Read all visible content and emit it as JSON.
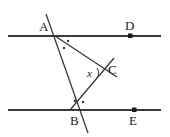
{
  "figure": {
    "type": "geometry-diagram",
    "background_color": "#ffffff",
    "stroke_color": "#3a3a3a",
    "text_color": "#1a1a1a"
  },
  "labels": {
    "a": "A",
    "b": "B",
    "c": "C",
    "d": "D",
    "e": "E",
    "x": "x"
  },
  "points": [
    {
      "name": "A",
      "label": "A",
      "x": 55,
      "y": 36,
      "label_x": 39,
      "label_y": 20,
      "marked_dot": false
    },
    {
      "name": "B",
      "label": "B",
      "x": 78,
      "y": 110,
      "label_x": 70,
      "label_y": 114,
      "marked_dot": false
    },
    {
      "name": "C",
      "label": "C",
      "x": 105,
      "y": 72,
      "label_x": 108,
      "label_y": 63,
      "marked_dot": false
    },
    {
      "name": "D",
      "label": "D",
      "x": 130,
      "y": 36,
      "label_x": 125,
      "label_y": 19,
      "marked_dot": true
    },
    {
      "name": "E",
      "label": "E",
      "x": 134,
      "y": 110,
      "label_x": 129,
      "label_y": 114,
      "marked_dot": true
    }
  ],
  "lines": [
    {
      "name": "upper-parallel-line",
      "x1": 8,
      "y1": 36,
      "x2": 161,
      "y2": 36
    },
    {
      "name": "lower-parallel-line",
      "x1": 8,
      "y1": 110,
      "x2": 161,
      "y2": 110
    },
    {
      "name": "transversal-ab",
      "x1": 46,
      "y1": 14,
      "x2": 88,
      "y2": 133
    },
    {
      "name": "segment-a-to-c",
      "x1": 55,
      "y1": 36,
      "x2": 117,
      "y2": 77
    },
    {
      "name": "segment-b-to-c",
      "x1": 70,
      "y1": 110,
      "x2": 114,
      "y2": 58
    }
  ],
  "angle_marks": [
    {
      "name": "angle-dot-a-upper",
      "x": 68,
      "y": 41
    },
    {
      "name": "angle-dot-a-lower",
      "x": 64,
      "y": 48
    },
    {
      "name": "angle-dot-b-left",
      "x": 75,
      "y": 101
    },
    {
      "name": "angle-dot-b-right",
      "x": 83,
      "y": 102
    },
    {
      "name": "angle-arc-x",
      "x": 99,
      "y": 73
    }
  ],
  "annotations": {
    "x_label_x": 87,
    "x_label_y": 68
  }
}
